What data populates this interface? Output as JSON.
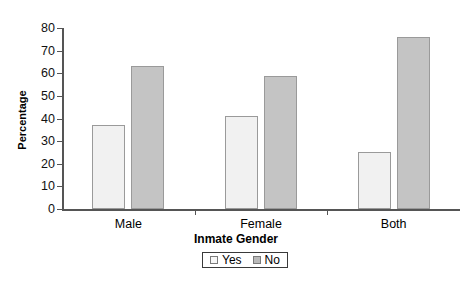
{
  "chart_data": {
    "type": "bar",
    "title": "",
    "xlabel": "Inmate Gender",
    "ylabel": "Percentage",
    "categories": [
      "Male",
      "Female",
      "Both"
    ],
    "series": [
      {
        "name": "Yes",
        "values": [
          37,
          41,
          25
        ],
        "color": "#f1f1f1"
      },
      {
        "name": "No",
        "values": [
          63,
          59,
          76
        ],
        "color": "#c4c4c4"
      }
    ],
    "ylim": [
      0,
      80
    ],
    "ytick_values": [
      0,
      10,
      20,
      30,
      40,
      50,
      60,
      70,
      80
    ],
    "ytick_labels": [
      "0",
      "10",
      "20",
      "30",
      "40",
      "50",
      "60",
      "70",
      "80"
    ],
    "grid": false,
    "legend_position": "bottom-center",
    "legend_entries": [
      "Yes",
      "No"
    ]
  },
  "axes": {
    "y_title": "Percentage",
    "x_title": "Inmate Gender"
  },
  "legend": {
    "entries": [
      {
        "label": "Yes",
        "swatch": "light-swatch-icon"
      },
      {
        "label": "No",
        "swatch": "gray-swatch-icon"
      }
    ]
  }
}
